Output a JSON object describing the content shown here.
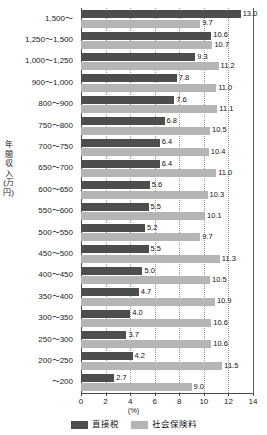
{
  "chart_data": {
    "type": "bar",
    "orientation": "horizontal",
    "title": "",
    "xlabel": "(%)",
    "ylabel": "年間収入\n(万円)",
    "ylabel_chars": "年間収入(万円)",
    "xlim": [
      0,
      14
    ],
    "xticks": [
      0,
      2,
      4,
      6,
      8,
      10,
      12,
      14
    ],
    "xtick_labels": [
      "0",
      "2",
      "4",
      "6",
      "8",
      "10",
      "12",
      "14"
    ],
    "grid": "vertical-dotted",
    "legend_position": "bottom-center",
    "categories": [
      "1,500〜",
      "1,250〜1,500",
      "1,000〜1,250",
      "900〜1,000",
      "800〜900",
      "750〜800",
      "700〜750",
      "650〜700",
      "600〜650",
      "550〜600",
      "500〜550",
      "450〜500",
      "400〜450",
      "350〜400",
      "300〜350",
      "250〜300",
      "200〜250",
      "〜200"
    ],
    "series": [
      {
        "name": "直接税",
        "color": "#4d4d4d",
        "values": [
          13.0,
          10.6,
          9.3,
          7.8,
          7.6,
          6.8,
          6.4,
          6.4,
          5.6,
          5.5,
          5.2,
          5.5,
          5.0,
          4.7,
          4.0,
          3.7,
          4.2,
          2.7
        ],
        "labels": [
          "13.0",
          "10.6",
          "9.3",
          "7.8",
          "7.6",
          "6.8",
          "6.4",
          "6.4",
          "5.6",
          "5.5",
          "5.2",
          "5.5",
          "5.0",
          "4.7",
          "4.0",
          "3.7",
          "4.2",
          "2.7"
        ]
      },
      {
        "name": "社会保険料",
        "color": "#b5b5b5",
        "values": [
          9.7,
          10.7,
          11.2,
          11.0,
          11.1,
          10.5,
          10.4,
          11.0,
          10.3,
          10.1,
          9.7,
          11.3,
          10.5,
          10.9,
          10.6,
          10.6,
          11.5,
          9.0
        ],
        "labels": [
          "9.7",
          "10.7",
          "11.2",
          "11.0",
          "11.1",
          "10.5",
          "10.4",
          "11.0",
          "10.3",
          "10.1",
          "9.7",
          "11.3",
          "10.5",
          "10.9",
          "10.6",
          "10.6",
          "11.5",
          "9.0"
        ]
      }
    ],
    "legend": [
      {
        "label": "直接税",
        "color": "#4d4d4d"
      },
      {
        "label": "社会保険料",
        "color": "#b5b5b5"
      }
    ]
  }
}
